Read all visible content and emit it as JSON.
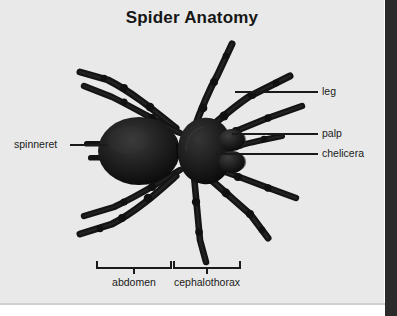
{
  "figure": {
    "title": "Spider Anatomy",
    "subject": "spider",
    "view": "dorsal",
    "background_color": "#e9e9e9",
    "ink_color": "#1a1a1a",
    "body_color": "#151515"
  },
  "callouts": [
    {
      "key": "spinneret",
      "label": "spinneret",
      "side": "left",
      "label_x": 14,
      "label_y": 141,
      "line_x1": 70,
      "line_x2": 108,
      "line_y": 145
    },
    {
      "key": "leg",
      "label": "leg",
      "side": "right",
      "label_x": 322,
      "label_y": 88,
      "line_x1": 235,
      "line_x2": 318,
      "line_y": 92
    },
    {
      "key": "palp",
      "label": "palp",
      "side": "right",
      "label_x": 322,
      "label_y": 130,
      "line_x1": 232,
      "line_x2": 318,
      "line_y": 134
    },
    {
      "key": "chelicera",
      "label": "chelicera",
      "side": "right",
      "label_x": 322,
      "label_y": 150,
      "line_x1": 216,
      "line_x2": 318,
      "line_y": 154
    }
  ],
  "brackets": [
    {
      "key": "abdomen",
      "label": "abdomen",
      "x_start": 97,
      "x_end": 171,
      "y": 268,
      "label_y": 279
    },
    {
      "key": "cephalothorax",
      "label": "cephalothorax",
      "x_start": 174,
      "x_end": 240,
      "y": 268,
      "label_y": 279
    }
  ]
}
